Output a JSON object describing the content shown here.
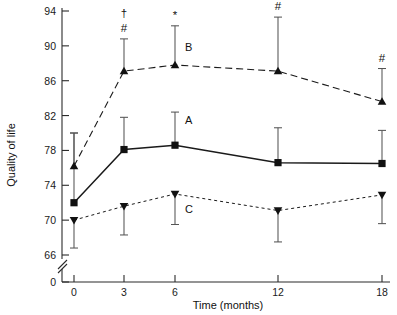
{
  "chart_data": {
    "type": "line",
    "title": "",
    "xlabel": "Time (months)",
    "ylabel": "Quality of life",
    "x": [
      0,
      3,
      6,
      12,
      18
    ],
    "xtick_labels": [
      "0",
      "3",
      "6",
      "12",
      "18"
    ],
    "ytick_labels": [
      "0",
      "66",
      "70",
      "74",
      "78",
      "82",
      "86",
      "90",
      "94"
    ],
    "ylim": [
      66,
      94
    ],
    "yaxis_break": true,
    "yaxis_break_note": "axis broken between 0 and 66",
    "grid": false,
    "legend_position": "inline-labels",
    "series": [
      {
        "name": "A",
        "label": "A",
        "marker": "square",
        "linestyle": "solid",
        "values": [
          72.0,
          78.1,
          78.6,
          76.6,
          76.5
        ],
        "err_upper": [
          80.0,
          81.8,
          82.4,
          80.6,
          80.3
        ],
        "err_lower": [
          72.0,
          78.1,
          78.6,
          76.6,
          76.5
        ]
      },
      {
        "name": "B",
        "label": "B",
        "marker": "triangle-up",
        "linestyle": "dashed-long",
        "values": [
          76.2,
          87.1,
          87.8,
          87.1,
          83.6
        ],
        "err_upper": [
          80.0,
          90.8,
          92.3,
          93.3,
          87.4
        ],
        "err_lower": [
          76.2,
          87.1,
          87.8,
          87.1,
          83.6
        ]
      },
      {
        "name": "C",
        "label": "C",
        "marker": "triangle-down",
        "linestyle": "dashed-short",
        "values": [
          70.0,
          71.6,
          73.0,
          71.1,
          72.9
        ],
        "err_upper": [
          70.0,
          71.6,
          73.0,
          71.1,
          72.9
        ],
        "err_lower": [
          66.8,
          68.3,
          69.5,
          67.5,
          69.6
        ]
      }
    ],
    "annotations": [
      {
        "x": 3,
        "symbols": [
          "†",
          "#"
        ]
      },
      {
        "x": 6,
        "symbols": [
          "*"
        ]
      },
      {
        "x": 12,
        "symbols": [
          "†",
          "#"
        ]
      },
      {
        "x": 18,
        "symbols": [
          "#"
        ]
      }
    ],
    "series_label_positions": [
      {
        "label": "B",
        "x": 6,
        "y": 89.4
      },
      {
        "label": "A",
        "x": 6,
        "y": 81.0
      },
      {
        "label": "C",
        "x": 6,
        "y": 70.8
      }
    ]
  }
}
